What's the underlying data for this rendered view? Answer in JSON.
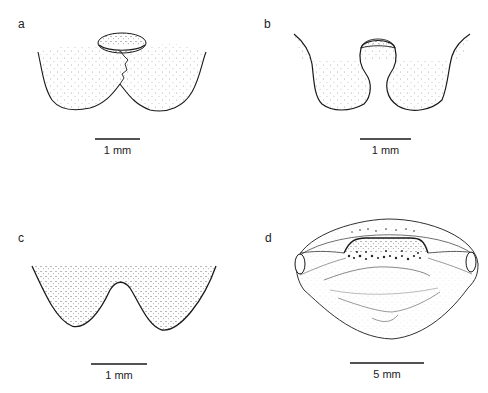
{
  "figure": {
    "panels": [
      {
        "id": "a",
        "label": "a",
        "scale_label": "1 mm"
      },
      {
        "id": "b",
        "label": "b",
        "scale_label": "1 mm"
      },
      {
        "id": "c",
        "label": "c",
        "scale_label": "1 mm"
      },
      {
        "id": "d",
        "label": "d",
        "scale_label": "5 mm"
      }
    ],
    "colors": {
      "line": "#1a1a1a",
      "stipple": "#555555",
      "background": "#ffffff"
    }
  }
}
